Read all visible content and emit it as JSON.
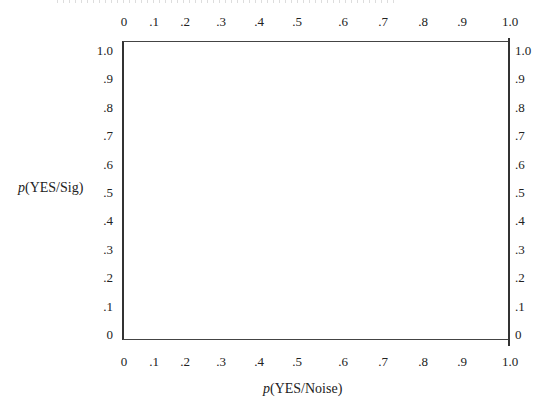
{
  "chart_data": {
    "type": "line",
    "title": "",
    "xlabel": "p(YES/Noise)",
    "ylabel": "p(YES/Sig)",
    "xlabel_parts": {
      "var": "p",
      "rest": "(YES/Noise)"
    },
    "ylabel_parts": {
      "var": "p",
      "rest": "(YES/Sig)"
    },
    "xlim": [
      0,
      1.0
    ],
    "ylim": [
      0,
      1.0
    ],
    "grid": false,
    "series": [],
    "x_ticks_top": [
      "0",
      ".1",
      ".2",
      ".3",
      ".4",
      ".5",
      ".6",
      ".7",
      ".8",
      ".9",
      "1.0"
    ],
    "x_ticks_bottom": [
      "0",
      ".1",
      ".2",
      ".3",
      ".4",
      ".5",
      ".6",
      ".7",
      ".8",
      ".9",
      "1.0"
    ],
    "y_ticks_left": [
      "1.0",
      ".9",
      ".8",
      ".7",
      ".6",
      ".5",
      ".4",
      ".3",
      ".2",
      ".1",
      "0"
    ],
    "y_ticks_right": [
      "1.0",
      ".9",
      ".8",
      ".7",
      ".6",
      ".5",
      ".4",
      ".3",
      ".2",
      ".1",
      "0"
    ],
    "note": "Empty ROC-style graph grid; no data plotted"
  },
  "layout": {
    "x_tick_positions": [
      124,
      154,
      185,
      221,
      259,
      297,
      343,
      383,
      423,
      462,
      510
    ],
    "y_tick_positions": [
      50,
      78,
      107,
      135,
      164,
      192,
      220,
      249,
      277,
      306,
      334
    ]
  }
}
